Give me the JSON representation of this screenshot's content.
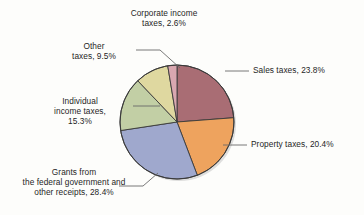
{
  "chart_data": {
    "type": "pie",
    "title": "",
    "subtitle": "",
    "xlabel": "",
    "ylabel": "",
    "legend_position": "none",
    "grid": false,
    "units": "percent",
    "total": 100.0,
    "start_angle_deg": 0,
    "direction": "clockwise",
    "categories": [
      "Sales taxes",
      "Property taxes",
      "Grants from the federal government and other receipts",
      "Individual income taxes",
      "Other taxes",
      "Corporate income taxes"
    ],
    "values": [
      23.8,
      20.4,
      28.4,
      15.3,
      9.5,
      2.6
    ],
    "colors": [
      "#a96d74",
      "#eea35e",
      "#9fa8cd",
      "#c2cfa5",
      "#dfd8a0",
      "#d9a7b0"
    ],
    "slices": [
      {
        "name": "Sales taxes",
        "value": 23.8,
        "label": "Sales taxes, 23.8%",
        "color": "#a96d74",
        "start_deg": 0.0,
        "end_deg": 85.68
      },
      {
        "name": "Property taxes",
        "value": 20.4,
        "label": "Property taxes, 20.4%",
        "color": "#eea35e",
        "start_deg": 85.68,
        "end_deg": 159.12
      },
      {
        "name": "Grants from the federal government and other receipts",
        "value": 28.4,
        "label": "Grants from\nthe federal government and\nother receipts, 28.4%",
        "color": "#9fa8cd",
        "start_deg": 159.12,
        "end_deg": 261.36
      },
      {
        "name": "Individual income taxes",
        "value": 15.3,
        "label": "Individual\nincome taxes,\n15.3%",
        "color": "#c2cfa5",
        "start_deg": 261.36,
        "end_deg": 316.44
      },
      {
        "name": "Other taxes",
        "value": 9.5,
        "label": "Other\ntaxes, 9.5%",
        "color": "#dfd8a0",
        "start_deg": 316.44,
        "end_deg": 350.64
      },
      {
        "name": "Corporate income taxes",
        "value": 2.6,
        "label": "Corporate income\ntaxes, 2.6%",
        "color": "#d9a7b0",
        "start_deg": 350.64,
        "end_deg": 360.0
      }
    ]
  },
  "labels": {
    "corporate": "Corporate income\ntaxes, 2.6%",
    "other": "Other\ntaxes, 9.5%",
    "individual": "Individual\nincome taxes,\n15.3%",
    "grants": "Grants from\nthe federal government and\nother receipts, 28.4%",
    "sales": "Sales taxes, 23.8%",
    "property": "Property taxes, 20.4%"
  },
  "style": {
    "background": "#fdfdfb",
    "outline": "#3a3a3a",
    "leader_line": "#5a5a5a",
    "text": "#1f1f1f"
  }
}
